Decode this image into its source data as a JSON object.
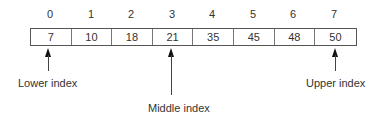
{
  "diagram": {
    "type": "array-binary-search",
    "indices": [
      "0",
      "1",
      "2",
      "3",
      "4",
      "5",
      "6",
      "7"
    ],
    "values": [
      "7",
      "10",
      "18",
      "21",
      "35",
      "45",
      "48",
      "50"
    ],
    "pointers": {
      "lower": {
        "label": "Lower index",
        "index": 0
      },
      "middle": {
        "label": "Middle index",
        "index": 3
      },
      "upper": {
        "label": "Upper index",
        "index": 7
      }
    }
  }
}
